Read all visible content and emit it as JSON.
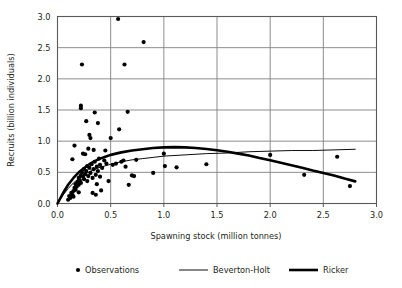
{
  "chart_data": {
    "type": "scatter",
    "title": "",
    "xlabel": "Spawning stock (million tonnes)",
    "ylabel": "Recruits  (billion individuals)",
    "xlim": [
      0.0,
      3.0
    ],
    "ylim": [
      0.0,
      3.0
    ],
    "xticks": [
      "0.0",
      "0.5",
      "1.0",
      "1.5",
      "2.0",
      "2.5",
      "3.0"
    ],
    "yticks": [
      "0.0",
      "0.5",
      "1.0",
      "1.5",
      "2.0",
      "2.5",
      "3.0"
    ],
    "xtick_values": [
      0.0,
      0.5,
      1.0,
      1.5,
      2.0,
      2.5,
      3.0
    ],
    "ytick_values": [
      0.0,
      0.5,
      1.0,
      1.5,
      2.0,
      2.5,
      3.0
    ],
    "grid": "both",
    "grid_color": "#808080",
    "frame_color": "#595959",
    "legend_position": "bottom",
    "series": [
      {
        "name": "Observations",
        "type": "scatter",
        "marker": "circle",
        "color": "#000000",
        "points": [
          [
            0.1,
            0.06
          ],
          [
            0.11,
            0.12
          ],
          [
            0.12,
            0.09
          ],
          [
            0.13,
            0.17
          ],
          [
            0.14,
            0.14
          ],
          [
            0.15,
            0.2
          ],
          [
            0.15,
            0.11
          ],
          [
            0.16,
            0.25
          ],
          [
            0.17,
            0.22
          ],
          [
            0.17,
            0.31
          ],
          [
            0.18,
            0.27
          ],
          [
            0.19,
            0.35
          ],
          [
            0.2,
            0.3
          ],
          [
            0.2,
            0.41
          ],
          [
            0.21,
            0.37
          ],
          [
            0.22,
            0.45
          ],
          [
            0.22,
            0.33
          ],
          [
            0.23,
            0.5
          ],
          [
            0.24,
            0.43
          ],
          [
            0.25,
            0.39
          ],
          [
            0.25,
            0.55
          ],
          [
            0.26,
            0.47
          ],
          [
            0.27,
            0.52
          ],
          [
            0.28,
            0.36
          ],
          [
            0.28,
            0.6
          ],
          [
            0.29,
            0.44
          ],
          [
            0.3,
            0.57
          ],
          [
            0.31,
            0.49
          ],
          [
            0.32,
            0.63
          ],
          [
            0.33,
            0.41
          ],
          [
            0.34,
            0.55
          ],
          [
            0.35,
            0.67
          ],
          [
            0.36,
            0.46
          ],
          [
            0.37,
            0.59
          ],
          [
            0.38,
            0.52
          ],
          [
            0.39,
            0.72
          ],
          [
            0.4,
            0.62
          ],
          [
            0.42,
            0.57
          ],
          [
            0.44,
            0.69
          ],
          [
            0.46,
            0.64
          ],
          [
            0.14,
            0.71
          ],
          [
            0.16,
            0.93
          ],
          [
            0.2,
            0.18
          ],
          [
            0.22,
            1.53
          ],
          [
            0.22,
            1.57
          ],
          [
            0.23,
            2.23
          ],
          [
            0.24,
            0.8
          ],
          [
            0.26,
            0.79
          ],
          [
            0.27,
            1.32
          ],
          [
            0.29,
            0.88
          ],
          [
            0.3,
            1.1
          ],
          [
            0.31,
            1.05
          ],
          [
            0.33,
            0.17
          ],
          [
            0.34,
            0.86
          ],
          [
            0.35,
            1.46
          ],
          [
            0.36,
            0.14
          ],
          [
            0.37,
            0.31
          ],
          [
            0.38,
            1.29
          ],
          [
            0.4,
            0.43
          ],
          [
            0.41,
            0.21
          ],
          [
            0.45,
            0.85
          ],
          [
            0.48,
            0.36
          ],
          [
            0.5,
            1.05
          ],
          [
            0.52,
            0.62
          ],
          [
            0.55,
            0.64
          ],
          [
            0.57,
            2.96
          ],
          [
            0.58,
            1.19
          ],
          [
            0.6,
            0.67
          ],
          [
            0.62,
            0.69
          ],
          [
            0.63,
            2.23
          ],
          [
            0.64,
            0.59
          ],
          [
            0.66,
            1.47
          ],
          [
            0.67,
            0.3
          ],
          [
            0.7,
            0.45
          ],
          [
            0.72,
            0.44
          ],
          [
            0.74,
            0.7
          ],
          [
            0.81,
            2.59
          ],
          [
            0.9,
            0.49
          ],
          [
            1.0,
            0.8
          ],
          [
            1.01,
            0.6
          ],
          [
            1.12,
            0.58
          ],
          [
            1.4,
            0.63
          ],
          [
            2.0,
            0.78
          ],
          [
            2.32,
            0.46
          ],
          [
            2.63,
            0.75
          ],
          [
            2.75,
            0.28
          ]
        ]
      },
      {
        "name": "Beverton-Holt",
        "type": "line",
        "color": "#000000",
        "linewidth": "thin",
        "points": [
          [
            0.0,
            0.0
          ],
          [
            0.05,
            0.13
          ],
          [
            0.1,
            0.24
          ],
          [
            0.15,
            0.33
          ],
          [
            0.2,
            0.4
          ],
          [
            0.25,
            0.46
          ],
          [
            0.3,
            0.51
          ],
          [
            0.35,
            0.55
          ],
          [
            0.4,
            0.58
          ],
          [
            0.5,
            0.63
          ],
          [
            0.6,
            0.67
          ],
          [
            0.7,
            0.7
          ],
          [
            0.8,
            0.72
          ],
          [
            0.9,
            0.74
          ],
          [
            1.0,
            0.76
          ],
          [
            1.2,
            0.78
          ],
          [
            1.4,
            0.8
          ],
          [
            1.6,
            0.81
          ],
          [
            1.8,
            0.83
          ],
          [
            2.0,
            0.84
          ],
          [
            2.2,
            0.85
          ],
          [
            2.4,
            0.85
          ],
          [
            2.6,
            0.86
          ],
          [
            2.8,
            0.87
          ]
        ]
      },
      {
        "name": "Ricker",
        "type": "line",
        "color": "#000000",
        "linewidth": "thick",
        "points": [
          [
            0.0,
            0.0
          ],
          [
            0.05,
            0.16
          ],
          [
            0.1,
            0.3
          ],
          [
            0.15,
            0.41
          ],
          [
            0.2,
            0.5
          ],
          [
            0.25,
            0.57
          ],
          [
            0.3,
            0.63
          ],
          [
            0.35,
            0.68
          ],
          [
            0.4,
            0.72
          ],
          [
            0.45,
            0.75
          ],
          [
            0.5,
            0.78
          ],
          [
            0.6,
            0.82
          ],
          [
            0.7,
            0.85
          ],
          [
            0.8,
            0.87
          ],
          [
            0.9,
            0.89
          ],
          [
            1.0,
            0.9
          ],
          [
            1.1,
            0.905
          ],
          [
            1.2,
            0.9
          ],
          [
            1.3,
            0.89
          ],
          [
            1.4,
            0.875
          ],
          [
            1.5,
            0.855
          ],
          [
            1.6,
            0.83
          ],
          [
            1.7,
            0.8
          ],
          [
            1.8,
            0.77
          ],
          [
            1.9,
            0.73
          ],
          [
            2.0,
            0.695
          ],
          [
            2.1,
            0.655
          ],
          [
            2.2,
            0.615
          ],
          [
            2.3,
            0.575
          ],
          [
            2.4,
            0.53
          ],
          [
            2.5,
            0.49
          ],
          [
            2.6,
            0.45
          ],
          [
            2.7,
            0.4
          ],
          [
            2.8,
            0.355
          ]
        ]
      }
    ]
  },
  "legend": {
    "items": [
      {
        "label": "Observations",
        "marker": "dot"
      },
      {
        "label": "Beverton-Holt",
        "marker": "thin-line"
      },
      {
        "label": "Ricker",
        "marker": "thick-line"
      }
    ]
  }
}
